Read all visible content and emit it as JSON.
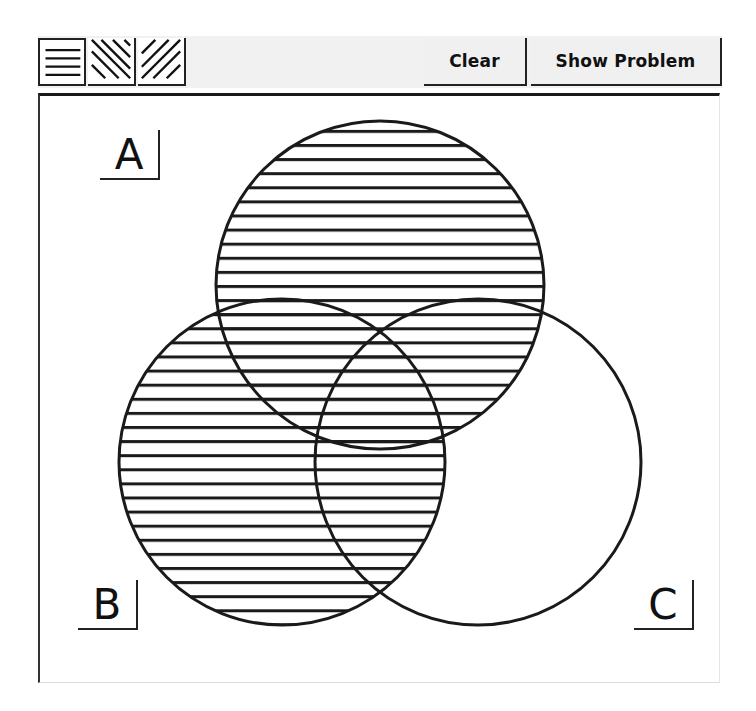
{
  "toolbar": {
    "pattern_buttons": [
      {
        "name": "horizontal-lines",
        "icon": "horizontal-hatch-icon",
        "selected": true
      },
      {
        "name": "diagonal-backslash-lines",
        "icon": "diagonal-backslash-hatch-icon",
        "selected": false
      },
      {
        "name": "diagonal-slash-lines",
        "icon": "diagonal-slash-hatch-icon",
        "selected": false
      }
    ],
    "clear_label": "Clear",
    "show_problem_label": "Show Problem"
  },
  "venn": {
    "labels": {
      "a": "A",
      "b": "B",
      "c": "C"
    },
    "circles": [
      {
        "id": "A",
        "cx": 380,
        "cy": 285,
        "r": 164
      },
      {
        "id": "B",
        "cx": 282,
        "cy": 462,
        "r": 163
      },
      {
        "id": "C",
        "cx": 478,
        "cy": 462,
        "r": 163
      }
    ],
    "shading": {
      "pattern": "horizontal-lines",
      "shaded_regions": [
        "A only",
        "B only",
        "A and B only",
        "A and C only",
        "B and C only",
        "A and B and C"
      ],
      "unshaded_regions": [
        "C only"
      ]
    },
    "colors": {
      "stroke": "#1a1a1a",
      "hatch": "#1a1a1a",
      "background": "#ffffff"
    }
  }
}
